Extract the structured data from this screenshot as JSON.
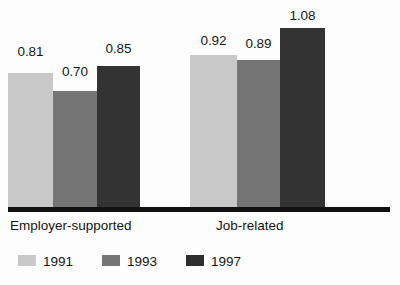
{
  "chart_data": {
    "type": "bar",
    "title": "",
    "xlabel": "",
    "ylabel": "",
    "ylim": [
      0,
      1.25
    ],
    "grid": false,
    "legend_position": "bottom-left",
    "categories": [
      "Employer-supported",
      "Job-related"
    ],
    "series": [
      {
        "name": "1991",
        "color": "#c8c8c8",
        "values": [
          0.81,
          0.92
        ]
      },
      {
        "name": "1993",
        "color": "#757575",
        "values": [
          0.7,
          0.89
        ]
      },
      {
        "name": "1997",
        "color": "#333333",
        "values": [
          0.85,
          1.08
        ]
      }
    ],
    "value_labels": [
      [
        "0.81",
        "0.70",
        "0.85"
      ],
      [
        "0.92",
        "0.89",
        "1.08"
      ]
    ]
  },
  "legend": {
    "items": [
      {
        "label": "1991"
      },
      {
        "label": "1993"
      },
      {
        "label": "1997"
      }
    ]
  },
  "axis": {
    "categories": [
      "Employer-supported",
      "Job-related"
    ]
  }
}
